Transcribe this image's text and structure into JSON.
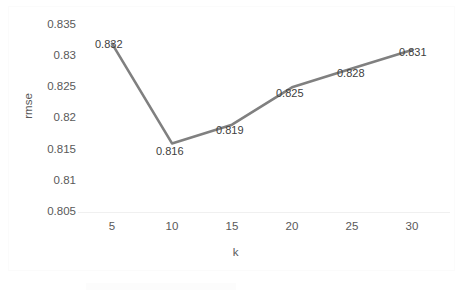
{
  "chart_data": {
    "type": "line",
    "title": "",
    "xlabel": "k",
    "ylabel": "rmse",
    "x": [
      5,
      10,
      15,
      20,
      25,
      30
    ],
    "categories": [
      "5",
      "10",
      "15",
      "20",
      "25",
      "30"
    ],
    "values": [
      0.832,
      0.816,
      0.819,
      0.825,
      0.828,
      0.831
    ],
    "point_labels": [
      "0.832",
      "0.816",
      "0.819",
      "0.825",
      "0.828",
      "0.831"
    ],
    "xtick_labels": [
      "5",
      "10",
      "15",
      "20",
      "25",
      "30"
    ],
    "ytick_labels": [
      "0.835",
      "0.83",
      "0.825",
      "0.82",
      "0.815",
      "0.81",
      "0.805"
    ],
    "ytick_values": [
      0.835,
      0.83,
      0.825,
      0.82,
      0.815,
      0.81,
      0.805
    ],
    "ylim": [
      0.805,
      0.835
    ],
    "xlim": [
      2.5,
      32.5
    ],
    "grid": false,
    "legend": false,
    "series_color": "#808080",
    "label_color": "#404040",
    "tick_color": "#595959",
    "background": "#ffffff"
  }
}
